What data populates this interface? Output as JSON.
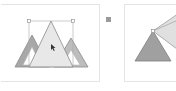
{
  "canvas": {
    "left_panel": {
      "label": "",
      "shapes": [
        {
          "type": "triangle",
          "role": "left-triangle",
          "fill": "#a8a8a8"
        },
        {
          "type": "triangle",
          "role": "center-triangle-selected",
          "fill": "#e8e8e8"
        },
        {
          "type": "triangle",
          "role": "right-triangle",
          "fill": "#bdbdbd"
        }
      ],
      "selection": {
        "visible": true,
        "stroke": "#9a9a9a"
      }
    },
    "right_panel": {
      "label": "",
      "shapes": [
        {
          "type": "triangle",
          "role": "rotated-triangle-dark",
          "fill": "#a0a0a0"
        },
        {
          "type": "triangle",
          "role": "rotated-triangle-light",
          "fill": "#e0e0e0"
        }
      ]
    },
    "colors": {
      "handle": "#9a9a9a",
      "border": "#e4e4e4"
    }
  }
}
